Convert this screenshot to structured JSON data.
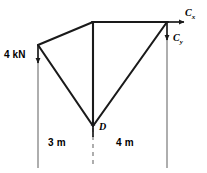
{
  "diagram": {
    "type": "free-body-diagram",
    "colors": {
      "member": "#1a1a1a",
      "extension_line": "#8c8c8c",
      "arrow": "#1a1a1a",
      "background": "#ffffff"
    },
    "geometry": {
      "nodes": [
        {
          "id": "A",
          "x": 38,
          "y": 45,
          "label": ""
        },
        {
          "id": "B",
          "x": 93,
          "y": 22,
          "label": ""
        },
        {
          "id": "C",
          "x": 167,
          "y": 22,
          "label": ""
        },
        {
          "id": "D",
          "x": 93,
          "y": 126,
          "label": "D"
        }
      ],
      "members": [
        {
          "from": "A",
          "to": "B"
        },
        {
          "from": "B",
          "to": "C"
        },
        {
          "from": "A",
          "to": "D"
        },
        {
          "from": "B",
          "to": "D"
        },
        {
          "from": "C",
          "to": "D"
        }
      ]
    },
    "forces": [
      {
        "name": "applied-load",
        "label": "4 kN",
        "at": "A",
        "direction": "down",
        "x": 38,
        "y_start": 45,
        "y_end": 63
      },
      {
        "name": "reaction-cx",
        "label": "C",
        "sublabel": "x",
        "at": "C",
        "direction": "right",
        "y": 22,
        "x_start": 167,
        "x_end": 184
      },
      {
        "name": "reaction-cy",
        "label": "C",
        "sublabel": "y",
        "at": "C",
        "direction": "down",
        "x": 167,
        "y_start": 22,
        "y_end": 40
      },
      {
        "name": "reaction-d",
        "label": "",
        "at": "D",
        "direction": "up",
        "x": 93,
        "y_start": 136,
        "y_end": 122
      }
    ],
    "extension_lines": [
      {
        "name": "left-extension-line",
        "x": 38,
        "y_start": 60,
        "y_end": 168,
        "style": "solid"
      },
      {
        "name": "center-extension-line",
        "x": 93,
        "y_start": 128,
        "y_end": 168,
        "style": "dashed"
      },
      {
        "name": "right-extension-line",
        "x": 167,
        "y_start": 34,
        "y_end": 168,
        "style": "solid"
      }
    ],
    "dimensions": [
      {
        "name": "dimension-left",
        "label": "3 m",
        "value": 3,
        "unit": "m",
        "from_x": 38,
        "to_x": 93,
        "text_x": 48,
        "text_y": 142
      },
      {
        "name": "dimension-right",
        "label": "4 m",
        "value": 4,
        "unit": "m",
        "from_x": 93,
        "to_x": 167,
        "text_x": 116,
        "text_y": 142
      }
    ],
    "labels": {
      "load": "4 kN",
      "node_d": "D",
      "reaction_cx_base": "C",
      "reaction_cx_sub": "x",
      "reaction_cy_base": "C",
      "reaction_cy_sub": "y",
      "dim_left": "3 m",
      "dim_right": "4 m"
    }
  }
}
